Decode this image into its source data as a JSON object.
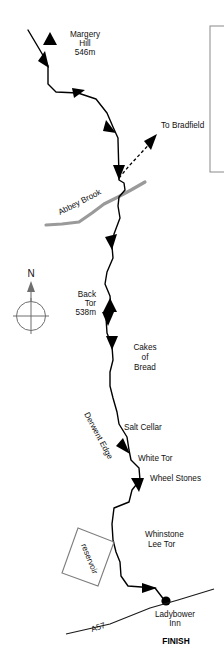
{
  "map": {
    "title": "Derwent Edge walking route map",
    "colors": {
      "route": "#000000",
      "brook": "#9a9a9a",
      "road": "#1a1a1a",
      "reservoir_outline": "#7d7d7d",
      "compass": "#6f6f6f",
      "text": "#111111",
      "background": "#ffffff"
    },
    "labels": {
      "margery_hill_name": "Margery",
      "margery_hill_name2": "Hill",
      "margery_hill_height": "546m",
      "to_bradfield": "To Bradfield",
      "abbey_brook": "Abbey Brook",
      "back_tor_name": "Back",
      "back_tor_name2": "Tor",
      "back_tor_height": "538m",
      "cakes_line1": "Cakes",
      "cakes_line2": "of",
      "cakes_line3": "Bread",
      "salt_cellar": "Salt Cellar",
      "white_tor": "White Tor",
      "wheel_stones": "Wheel Stones",
      "derwent_edge": "Derwent Edge",
      "whinstone_line1": "Whinstone",
      "whinstone_line2": "Lee Tor",
      "reservoir": "reservoir",
      "road_a57": "A57",
      "ladybower_line1": "Ladybower",
      "ladybower_line2": "Inn",
      "finish": "FINISH"
    },
    "compass": {
      "north_letter": "N"
    },
    "features": [
      {
        "name": "Margery Hill",
        "type": "summit",
        "height_m": 546
      },
      {
        "name": "Back Tor",
        "type": "summit",
        "height_m": 538
      },
      {
        "name": "Cakes of Bread",
        "type": "rock-formation"
      },
      {
        "name": "Salt Cellar",
        "type": "rock-formation"
      },
      {
        "name": "White Tor",
        "type": "rock-formation"
      },
      {
        "name": "Wheel Stones",
        "type": "rock-formation"
      },
      {
        "name": "Whinstone Lee Tor",
        "type": "rock-formation"
      },
      {
        "name": "Derwent Edge",
        "type": "ridge"
      },
      {
        "name": "Abbey Brook",
        "type": "watercourse"
      },
      {
        "name": "A57",
        "type": "road"
      },
      {
        "name": "Ladybower Inn",
        "type": "finish-point"
      }
    ],
    "geometry": {
      "route_path": "M 28,30 L 44,57 L 48,66 L 48,84 L 56,92 L 78,93 L 96,99 L 107,113 L 113,127 L 118,138 L 118,140 L 119,176 L 119,180 L 124,183 L 125,190 L 119,197 L 118,206 L 120,218 L 114,234 L 112,246 L 113,258 L 107,272 L 105,284 L 110,296 L 111,308 L 106,318 L 107,333 L 112,346 L 113,360 L 110,372 L 110,386 L 113,398 L 117,412 L 119,424 L 127,437 L 129,450 L 131,460 L 139,468 L 140,480 L 132,490 L 129,502 L 114,508 L 112,524 L 113,540 L 116,552 L 120,562 L 121,576 L 128,586 L 155,588 L 165,601",
      "spur_path": "M 119,178 L 129,166 L 142,152 L 155,138",
      "brook_path": "M 46,225 L 62,224 L 79,222 L 92,213 L 104,204 L 118,197 L 131,190 L 145,182",
      "road_path": "M 66,634 L 110,624 L 150,608 L 178,600 L 214,589",
      "reservoir_path": "M 78,528 L 114,542 L 98,586 L 62,573 Z"
    }
  }
}
